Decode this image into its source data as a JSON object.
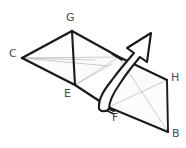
{
  "figure": {
    "kind": "geometric-net-folding-diagram",
    "background_color": "#ffffff",
    "width": 186,
    "height": 148,
    "stroke_dark": "#1a1a1a",
    "stroke_light": "#b4b4b4",
    "stroke_arrow": "#1a1a1a",
    "fill_face": "#fbfbfb",
    "label_color": "#4a4a4a",
    "labels": [
      {
        "id": "G",
        "text": "G",
        "x": 66,
        "y": 12
      },
      {
        "id": "C",
        "text": "C",
        "x": 9,
        "y": 48
      },
      {
        "id": "H",
        "text": "H",
        "x": 171,
        "y": 72
      },
      {
        "id": "E",
        "text": "E",
        "x": 64,
        "y": 88
      },
      {
        "id": "F",
        "text": "F",
        "x": 112,
        "y": 112
      },
      {
        "id": "B",
        "text": "B",
        "x": 172,
        "y": 128
      }
    ],
    "vertices": {
      "C": [
        22,
        58
      ],
      "G": [
        72,
        31
      ],
      "D": [
        119,
        57
      ],
      "E": [
        75,
        85
      ],
      "F": [
        109,
        107
      ],
      "H": [
        167,
        80
      ],
      "B": [
        168,
        132
      ],
      "A": [
        105,
        104
      ],
      "M": [
        95,
        60
      ]
    },
    "dark_edges": [
      {
        "name": "edge-C-G",
        "points": "22,58 72,31"
      },
      {
        "name": "edge-G-D",
        "points": "72,31 119,57"
      },
      {
        "name": "edge-C-E",
        "points": "22,58 75,85"
      },
      {
        "name": "edge-G-E",
        "points": "72,31 75,85"
      },
      {
        "name": "edge-E-A",
        "points": "75,85 105,104"
      },
      {
        "name": "edge-D-H",
        "points": "119,57 167,80"
      },
      {
        "name": "edge-H-B",
        "points": "167,80 168,132"
      },
      {
        "name": "edge-F-B",
        "points": "109,107 168,132"
      },
      {
        "name": "edge-A-F",
        "points": "100,104 113,110"
      }
    ],
    "light_edges": [
      {
        "name": "edge-C-D-light",
        "points": "22,58 119,57"
      },
      {
        "name": "edge-C-mid-light",
        "points": "22,58 95,60"
      },
      {
        "name": "edge-G-Dmid-light",
        "points": "72,31 119,57"
      },
      {
        "name": "edge-E-D-light",
        "points": "75,85 119,57"
      },
      {
        "name": "edge-D-B-light",
        "points": "119,57 168,132"
      },
      {
        "name": "edge-F-H-light",
        "points": "109,107 167,80"
      },
      {
        "name": "edge-Emid-light",
        "points": "75,85 112,64"
      }
    ],
    "arrow": {
      "name": "fold-direction-arrow",
      "description": "curved outlined arrow sweeping from the fold line near F upward to the right",
      "outline": "M 99,108 C 99,100 104,92 112,82 C 120,71 127,62 133,54 L 126,49 L 150,34 L 146,61 L 139,57 C 133,65 126,75 119,86 C 112,96 108,102 108,108 Z"
    }
  }
}
